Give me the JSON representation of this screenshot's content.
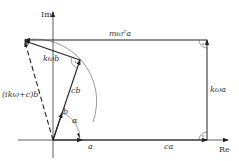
{
  "diagram": {
    "type": "phasor-diagram",
    "axes": {
      "real_label": "Re",
      "imag_label": "Im"
    },
    "vectors": [
      {
        "id": "a",
        "label": "a",
        "from": "origin",
        "direction": "Re"
      },
      {
        "id": "ca",
        "label": "ca",
        "direction": "Re"
      },
      {
        "id": "kwa",
        "label": "kωa",
        "direction": "Im"
      },
      {
        "id": "mw2a",
        "label": "mω²a",
        "direction": "-Re"
      },
      {
        "id": "b",
        "label": "b",
        "from": "origin"
      },
      {
        "id": "cb",
        "label": "cb",
        "from": "origin"
      },
      {
        "id": "kwb",
        "label": "kωb"
      },
      {
        "id": "ikwc_b",
        "label": "(ikω+c)b",
        "from": "origin",
        "style": "dashed"
      }
    ],
    "angle_label": "α",
    "right_angle_marks": 4,
    "colors": {
      "line": "#333333",
      "background": "#ffffff"
    }
  }
}
